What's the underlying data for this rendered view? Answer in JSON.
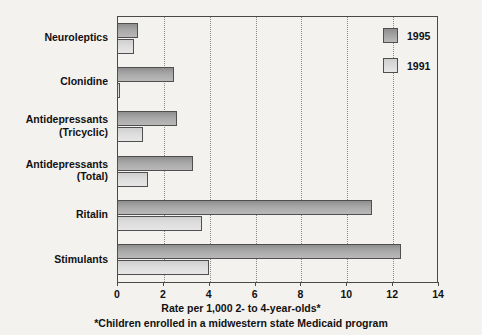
{
  "chart_data": {
    "type": "bar",
    "orientation": "horizontal",
    "title": "",
    "xlabel": "Rate per 1,000 2- to 4-year-olds*",
    "ylabel": "",
    "footnote": "*Children enrolled in a midwestern state Medicaid program",
    "xlim": [
      0,
      14
    ],
    "xticks": [
      0,
      2,
      4,
      6,
      8,
      10,
      12,
      14
    ],
    "xtick_labels": [
      "0",
      "2",
      "4",
      "6",
      "8",
      "10",
      "12",
      "14"
    ],
    "grid": true,
    "grid_axis": "x",
    "grid_style": "dotted",
    "legend_position": "top-right",
    "categories": [
      "Neuroleptics",
      "Clonidine",
      "Antidepressants\n(Tricyclic)",
      "Antidepressants\n(Total)",
      "Ritalin",
      "Stimulants"
    ],
    "series": [
      {
        "name": "1995",
        "color": "#a8a8a8",
        "values": [
          0.9,
          2.5,
          2.6,
          3.3,
          11.1,
          12.4
        ]
      },
      {
        "name": "1991",
        "color": "#dddddd",
        "values": [
          0.75,
          0.15,
          1.15,
          1.35,
          3.7,
          4.0
        ]
      }
    ]
  },
  "legend": {
    "items": [
      {
        "label": "1995"
      },
      {
        "label": "1991"
      }
    ]
  },
  "colors": {
    "background": "#f4f2ef",
    "axis": "#4a4a4a",
    "grid": "#8a8a8a",
    "text": "#111111",
    "series_1995": "#a8a8a8",
    "series_1991": "#dddddd"
  }
}
